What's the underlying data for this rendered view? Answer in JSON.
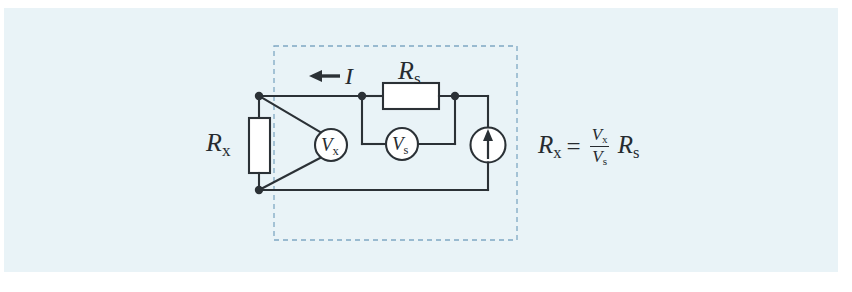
{
  "page": {
    "background_color": "#ffffff",
    "paper_color": "#e9f3f7",
    "ink_color": "#262b30"
  },
  "diagram": {
    "type": "electrical-schematic",
    "dashed_box": {
      "label": "measurement-region",
      "color": "#7fa8c4",
      "x": 274,
      "y": 46,
      "width": 243,
      "height": 194
    },
    "components": [
      {
        "name": "resistor-rx",
        "kind": "resistor",
        "label": "R",
        "subscript": "x",
        "orientation": "vertical"
      },
      {
        "name": "resistor-rs",
        "kind": "resistor",
        "label": "R",
        "subscript": "s",
        "orientation": "horizontal"
      },
      {
        "name": "voltmeter-vx",
        "kind": "voltmeter",
        "label": "V",
        "subscript": "x"
      },
      {
        "name": "voltmeter-vs",
        "kind": "voltmeter",
        "label": "V",
        "subscript": "s"
      },
      {
        "name": "current-source",
        "kind": "current-source",
        "arrow_direction": "up"
      }
    ],
    "current_arrow": {
      "name": "current-direction-arrow",
      "label": "I",
      "direction": "left"
    }
  },
  "equation": {
    "lhs": "R",
    "lhs_sub": "x",
    "sign": "=",
    "numerator": "V",
    "numerator_sub": "x",
    "denominator": "V",
    "denominator_sub": "s",
    "rhs": "R",
    "rhs_sub": "s"
  }
}
